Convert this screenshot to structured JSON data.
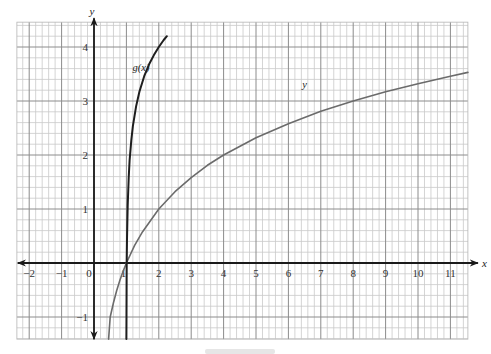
{
  "chart_data": {
    "type": "line",
    "title": "",
    "xlabel": "x",
    "ylabel": "y",
    "xlim": [
      -2.38,
      11.54
    ],
    "ylim": [
      -1.41,
      4.46
    ],
    "grid": true,
    "grid_minor_step": 0.2,
    "x_ticks": [
      -2,
      -1,
      0,
      1,
      2,
      3,
      4,
      5,
      6,
      7,
      8,
      9,
      10,
      11
    ],
    "x_tick_labels": [
      "−2",
      "−1",
      "0",
      "1",
      "2",
      "3",
      "4",
      "5",
      "6",
      "7",
      "8",
      "9",
      "10",
      "11"
    ],
    "y_ticks": [
      -1,
      1,
      2,
      3,
      4
    ],
    "y_tick_labels": [
      "−1",
      "1",
      "2",
      "3",
      "4"
    ],
    "series": [
      {
        "name": "y",
        "label": "y",
        "color": "#6b6b6b",
        "width": 1.6,
        "label_pos": [
          6.5,
          3.25
        ],
        "x": [
          0.45,
          0.5,
          0.6,
          0.7,
          0.8,
          0.9,
          1,
          1.25,
          1.5,
          2,
          2.5,
          3,
          3.5,
          4,
          5,
          6,
          7,
          8,
          9,
          10,
          11,
          11.54
        ],
        "y": [
          -1.41,
          -1.0,
          -0.74,
          -0.51,
          -0.32,
          -0.15,
          0,
          0.32,
          0.58,
          1.0,
          1.32,
          1.58,
          1.81,
          2.0,
          2.32,
          2.58,
          2.81,
          3.0,
          3.17,
          3.32,
          3.46,
          3.53
        ]
      },
      {
        "name": "g(x)",
        "label": "g(x)",
        "color": "#1e1e1e",
        "width": 2.0,
        "label_pos": [
          1.45,
          3.55
        ],
        "x": [
          1.0,
          1.002,
          1.005,
          1.01,
          1.02,
          1.04,
          1.07,
          1.1,
          1.15,
          1.2,
          1.3,
          1.4,
          1.55,
          1.7,
          1.85,
          2.0,
          2.15,
          2.25
        ],
        "y": [
          -1.41,
          -1.0,
          -0.5,
          0.0,
          0.44,
          1.07,
          1.58,
          1.9,
          2.27,
          2.54,
          2.9,
          3.17,
          3.46,
          3.68,
          3.85,
          4.0,
          4.13,
          4.2
        ]
      }
    ]
  }
}
